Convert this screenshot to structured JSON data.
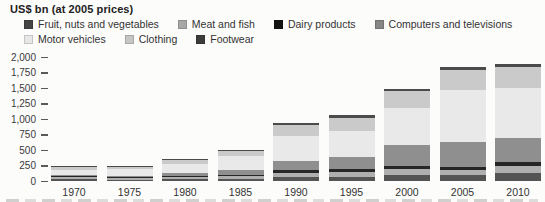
{
  "title": "US$ bn (at 2005 prices)",
  "legend": {
    "rows": [
      [
        "Fruit, nuts and vegetables",
        "Meat and fish",
        "Dairy products",
        "Computers and televisions"
      ],
      [
        "Motor vehicles",
        "Clothing",
        "Footwear"
      ]
    ]
  },
  "chart_data": {
    "type": "bar",
    "stacked": true,
    "title": "US$ bn (at 2005 prices)",
    "xlabel": "",
    "ylabel": "US$ bn (at 2005 prices)",
    "ylim": [
      0,
      2000
    ],
    "grid": false,
    "legend_position": "top",
    "categories": [
      "1970",
      "1975",
      "1980",
      "1985",
      "1990",
      "1995",
      "2000",
      "2005",
      "2010"
    ],
    "series": [
      {
        "name": "Fruit, nuts and vegetables",
        "color": "#454545",
        "values": [
          30,
          22,
          25,
          30,
          60,
          70,
          100,
          95,
          130
        ]
      },
      {
        "name": "Meat and fish",
        "color": "#a8a8a8",
        "values": [
          35,
          30,
          38,
          45,
          70,
          80,
          90,
          75,
          105
        ]
      },
      {
        "name": "Dairy products",
        "color": "#141414",
        "values": [
          18,
          16,
          20,
          25,
          40,
          45,
          55,
          60,
          65
        ]
      },
      {
        "name": "Computers and televisions",
        "color": "#868686",
        "values": [
          12,
          18,
          40,
          80,
          160,
          200,
          330,
          398,
          388
        ]
      },
      {
        "name": "Motor vehicles",
        "color": "#e7e7e7",
        "values": [
          90,
          105,
          160,
          220,
          390,
          420,
          600,
          836,
          808
        ]
      },
      {
        "name": "Clothing",
        "color": "#c6c6c6",
        "values": [
          50,
          50,
          60,
          85,
          180,
          210,
          270,
          323,
          348
        ]
      },
      {
        "name": "Footwear",
        "color": "#3c3c3c",
        "values": [
          15,
          9,
          12,
          15,
          30,
          35,
          45,
          53,
          52
        ]
      }
    ],
    "totals": [
      250,
      250,
      355,
      500,
      930,
      1060,
      1490,
      1840,
      1896
    ],
    "yticks": [
      {
        "value": 0,
        "label": "0"
      },
      {
        "value": 250,
        "label": "250"
      },
      {
        "value": 500,
        "label": "500"
      },
      {
        "value": 750,
        "label": "750"
      },
      {
        "value": 1000,
        "label": "1,000"
      },
      {
        "value": 1250,
        "label": "1,250"
      },
      {
        "value": 1500,
        "label": "1,500"
      },
      {
        "value": 1750,
        "label": "1,750"
      },
      {
        "value": 2000,
        "label": "2,000"
      }
    ]
  }
}
